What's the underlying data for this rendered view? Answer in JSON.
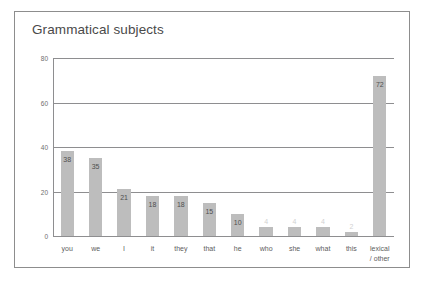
{
  "figure": {
    "title": "Grammatical subjects",
    "frame_color": "#8d8d8d",
    "background": "#ffffff"
  },
  "chart_data": {
    "type": "bar",
    "title": "Grammatical subjects",
    "xlabel": "",
    "ylabel": "",
    "ylim": [
      0,
      80
    ],
    "yticks": [
      0,
      20,
      40,
      60,
      80
    ],
    "ytick_labels": [
      "0",
      "20",
      "40",
      "60",
      "80"
    ],
    "grid": true,
    "legend": "none",
    "bar_color": "#bdbdbd",
    "categories": [
      "you",
      "we",
      "I",
      "it",
      "they",
      "that",
      "he",
      "who",
      "she",
      "what",
      "this",
      "lexical\n/ other"
    ],
    "values": [
      38,
      35,
      21,
      18,
      18,
      15,
      10,
      4,
      4,
      4,
      2,
      72
    ],
    "value_labels": [
      "38",
      "35",
      "21",
      "18",
      "18",
      "15",
      "10",
      "4",
      "4",
      "4",
      "2",
      "72"
    ]
  }
}
